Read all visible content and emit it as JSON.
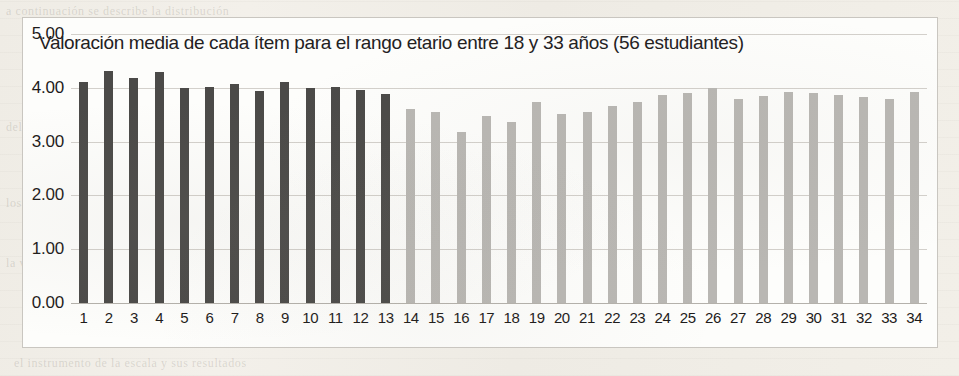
{
  "chart_data": {
    "type": "bar",
    "title": "Valoración media de cada ítem para el rango etario entre 18 y 33 años (56 estudiantes)",
    "xlabel": "",
    "ylabel": "",
    "ylim": [
      0,
      5
    ],
    "ytick_labels": [
      "5.00",
      "4.00",
      "3.00",
      "2.00",
      "1.00",
      "0.00"
    ],
    "ytick_values": [
      5,
      4,
      3,
      2,
      1,
      0
    ],
    "grid": true,
    "legend": "none",
    "categories": [
      "1",
      "2",
      "3",
      "4",
      "5",
      "6",
      "7",
      "8",
      "9",
      "10",
      "11",
      "12",
      "13",
      "14",
      "15",
      "16",
      "17",
      "18",
      "19",
      "20",
      "21",
      "22",
      "23",
      "24",
      "25",
      "26",
      "27",
      "28",
      "29",
      "30",
      "31",
      "32",
      "33",
      "34"
    ],
    "values": [
      4.11,
      4.32,
      4.18,
      4.29,
      4.0,
      4.02,
      4.07,
      3.95,
      4.11,
      4.0,
      4.02,
      3.96,
      3.88,
      3.61,
      3.55,
      3.18,
      3.48,
      3.36,
      3.73,
      3.52,
      3.55,
      3.66,
      3.73,
      3.86,
      3.91,
      4.0,
      3.79,
      3.84,
      3.93,
      3.91,
      3.86,
      3.82,
      3.8,
      3.93
    ],
    "bar_colors": [
      "dark",
      "dark",
      "dark",
      "dark",
      "dark",
      "dark",
      "dark",
      "dark",
      "dark",
      "dark",
      "dark",
      "dark",
      "dark",
      "light",
      "light",
      "light",
      "light",
      "light",
      "light",
      "light",
      "light",
      "light",
      "light",
      "light",
      "light",
      "light",
      "light",
      "light",
      "light",
      "light",
      "light",
      "light",
      "light",
      "light"
    ],
    "colors": {
      "dark_series": "#4b4a48",
      "light_series": "#b9b7b3",
      "gridline": "#d3d0cb",
      "plot_background": "#fdfdfb",
      "page_background": "#efece5",
      "text": "#1d1b1a"
    }
  },
  "background_ghost_text": [
    "el instrumento de la escala y sus resultados",
    "del análisis realizado sobre los datos obtenidos",
    "los estudiantes de la muestra seleccionada",
    "la valoración media de los ítems evaluados",
    "a continuación se describe la distribución"
  ]
}
